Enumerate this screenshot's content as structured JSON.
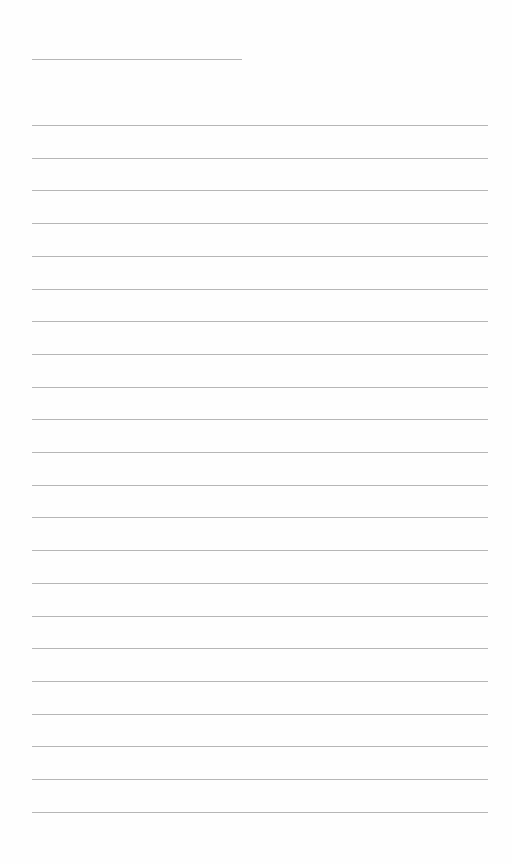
{
  "page": {
    "type": "lined-paper",
    "background_color": "#fefefe",
    "line_color": "#b6b6b6",
    "header_line": {
      "x": 32,
      "y": 59,
      "width": 210
    },
    "ruled_lines": {
      "count": 22,
      "x": 32,
      "width": 456,
      "first_y": 125,
      "spacing": 32.7
    }
  }
}
